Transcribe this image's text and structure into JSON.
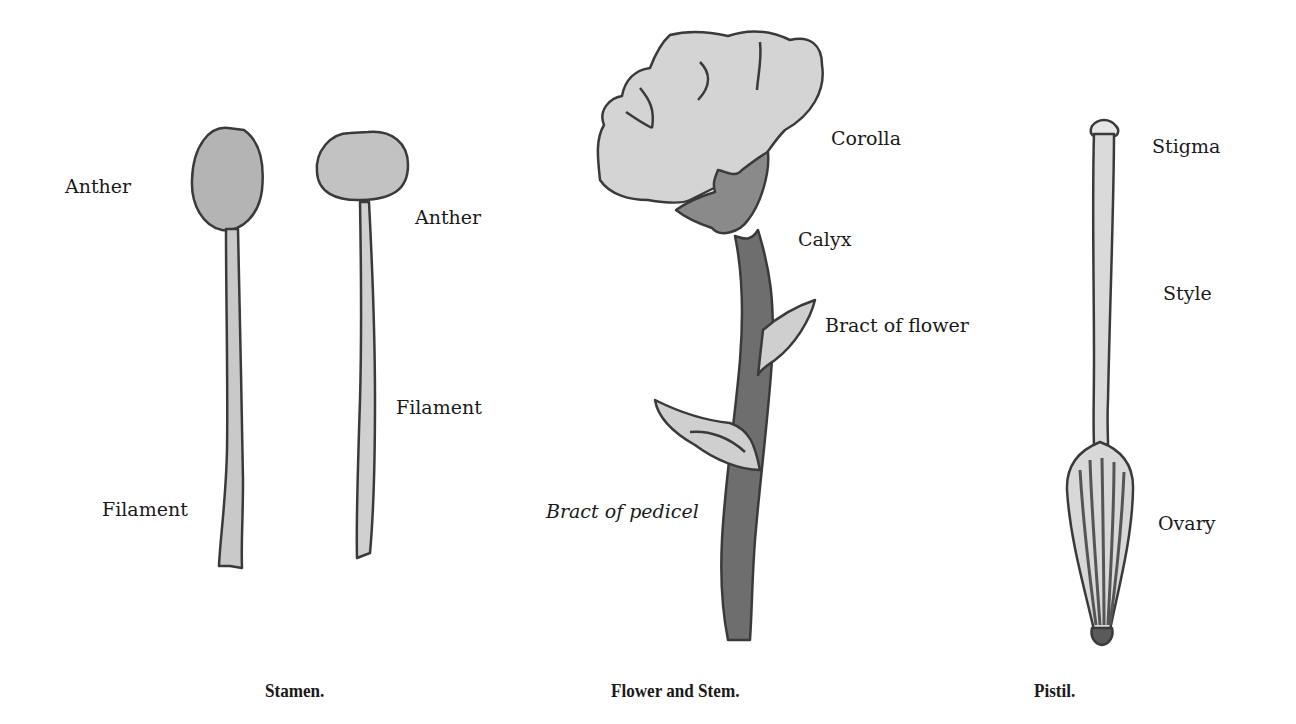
{
  "figures": {
    "stamen": {
      "caption": "Stamen.",
      "labels": {
        "anther_left": "Anther",
        "anther_right": "Anther",
        "filament_left": "Filament",
        "filament_right": "Filament"
      }
    },
    "flower": {
      "caption": "Flower and Stem.",
      "labels": {
        "corolla": "Corolla",
        "calyx": "Calyx",
        "bract_flower": "Bract of flower",
        "bract_pedicel": "Bract of pedicel"
      }
    },
    "pistil": {
      "caption": "Pistil.",
      "labels": {
        "stigma": "Stigma",
        "style": "Style",
        "ovary": "Ovary"
      }
    }
  },
  "colors": {
    "outline": "#3a3a3a",
    "light_fill": "#d2d2d2",
    "mid_fill": "#a8a8a8",
    "dark_fill": "#777777"
  }
}
